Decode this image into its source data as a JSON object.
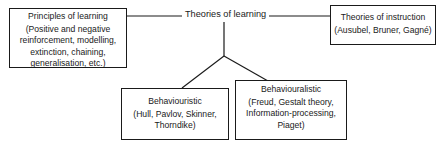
{
  "diagram": {
    "center": {
      "title": "Theories of learning"
    },
    "left_box": {
      "title": "Principles of learning",
      "body": "(Positive and negative reinforcement, modelling, extinction, chaining, generalisation, etc.)"
    },
    "right_box": {
      "title": "Theories of instruction",
      "body": "(Ausubel, Bruner, Gagné)"
    },
    "bottom_left_box": {
      "title": "Behaviouristic",
      "body": "(Hull, Pavlov, Skinner, Thorndike)"
    },
    "bottom_right_box": {
      "title": "Behaviouralistic",
      "body": "(Freud, Gestalt theory, Information-processing, Piaget)"
    },
    "edges": [
      {
        "from": "left_box",
        "to": "center"
      },
      {
        "from": "center",
        "to": "right_box"
      },
      {
        "from": "center",
        "to": "bottom_left_box"
      },
      {
        "from": "center",
        "to": "bottom_right_box"
      }
    ]
  }
}
